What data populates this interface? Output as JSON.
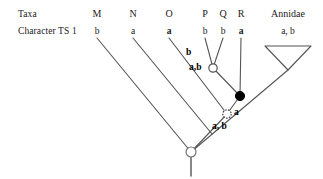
{
  "figure": {
    "row_labels": {
      "taxa": "Taxa",
      "character": "Character TS 1"
    },
    "taxa": [
      {
        "name": "M",
        "state": "b",
        "bold": false,
        "x": 97,
        "tip_y": 38
      },
      {
        "name": "N",
        "state": "a",
        "bold": false,
        "x": 133,
        "tip_y": 38
      },
      {
        "name": "O",
        "state": "a",
        "bold": true,
        "x": 169,
        "tip_y": 38
      },
      {
        "name": "P",
        "state": "b",
        "bold": false,
        "x": 205,
        "tip_y": 38
      },
      {
        "name": "Q",
        "state": "b",
        "bold": false,
        "x": 223,
        "tip_y": 38
      },
      {
        "name": "R",
        "state": "a",
        "bold": true,
        "x": 241,
        "tip_y": 38
      },
      {
        "name": "Annidae",
        "state": "a, b",
        "bold": false,
        "x": 288,
        "tip_y": 38
      }
    ],
    "internal_nodes": [
      {
        "id": "node-pq",
        "type": "open",
        "x": 213,
        "y": 68,
        "label": "a,b",
        "label_x": 196,
        "label_y": 68
      },
      {
        "id": "node-pqr",
        "type": "filled",
        "x": 240,
        "y": 96,
        "label": "",
        "label_x": 0,
        "label_y": 0
      },
      {
        "id": "node-mnopqr",
        "type": "open-dotted",
        "x": 227,
        "y": 114,
        "label": "a",
        "label_x": 236,
        "label_y": 113
      },
      {
        "id": "node-root",
        "type": "open",
        "x": 191,
        "y": 152,
        "label": "a, b",
        "label_x": 216,
        "label_y": 128
      }
    ],
    "branch_labels": [
      {
        "text": "b",
        "x": 189,
        "y": 53
      }
    ],
    "clade_triangle": {
      "name": "Annidae",
      "apex_x": 288,
      "apex_y": 70,
      "left_x": 265,
      "right_x": 311,
      "top_y": 46
    },
    "colors": {
      "line": "#555555",
      "node_fill_open": "#ffffff",
      "node_fill_closed": "#000000",
      "node_stroke": "#666666",
      "text": "#1a1a1a"
    },
    "root_stem": {
      "x": 191,
      "y_top": 152,
      "y_bottom": 176
    }
  }
}
